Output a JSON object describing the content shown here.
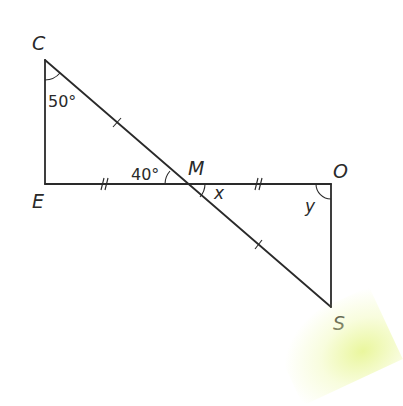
{
  "diagram": {
    "type": "geometry",
    "colors": {
      "line": "#2a2a2a",
      "background": "#ffffff",
      "glow": "#e6f58c"
    },
    "vertices": [
      {
        "id": "C",
        "label": "C",
        "x": 45,
        "y": 60
      },
      {
        "id": "E",
        "label": "E",
        "x": 45,
        "y": 184
      },
      {
        "id": "M",
        "label": "M",
        "x": 185,
        "y": 184
      },
      {
        "id": "O",
        "label": "O",
        "x": 331,
        "y": 184
      },
      {
        "id": "S",
        "label": "S",
        "x": 331,
        "y": 307
      }
    ],
    "angles": {
      "C": "50°",
      "EMC": "40°",
      "OMS": "x",
      "O": "y"
    },
    "tick_marks": {
      "CM": "single",
      "MS": "single",
      "EM": "double",
      "MO": "double"
    }
  }
}
